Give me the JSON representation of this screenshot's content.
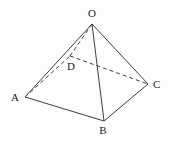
{
  "figure": {
    "background_color": "#fdfdfd",
    "line_color": "#3d3d3d",
    "label_color": "#1c1c1c",
    "canvas": {
      "width": 170,
      "height": 147
    },
    "vertices": {
      "O": {
        "label": "O",
        "x": 92,
        "y": 24,
        "label_x": 92,
        "label_y": 17,
        "anchor": "middle"
      },
      "A": {
        "label": "A",
        "x": 25,
        "y": 97,
        "label_x": 19,
        "label_y": 101,
        "anchor": "end"
      },
      "B": {
        "label": "B",
        "x": 104,
        "y": 121,
        "label_x": 103,
        "label_y": 134,
        "anchor": "middle"
      },
      "C": {
        "label": "C",
        "x": 148,
        "y": 84,
        "label_x": 153,
        "label_y": 88,
        "anchor": "start"
      },
      "D": {
        "label": "D",
        "x": 70,
        "y": 56,
        "label_x": 71,
        "label_y": 70,
        "anchor": "middle"
      }
    },
    "edges": [
      {
        "from": "O",
        "to": "A",
        "style": "solid"
      },
      {
        "from": "O",
        "to": "B",
        "style": "solid"
      },
      {
        "from": "O",
        "to": "C",
        "style": "solid"
      },
      {
        "from": "A",
        "to": "B",
        "style": "solid"
      },
      {
        "from": "B",
        "to": "C",
        "style": "solid"
      },
      {
        "from": "O",
        "to": "D",
        "style": "dashed"
      },
      {
        "from": "A",
        "to": "D",
        "style": "dashed"
      },
      {
        "from": "D",
        "to": "C",
        "style": "dashed"
      }
    ],
    "dash_pattern": "4 3",
    "stroke_width": 1
  }
}
